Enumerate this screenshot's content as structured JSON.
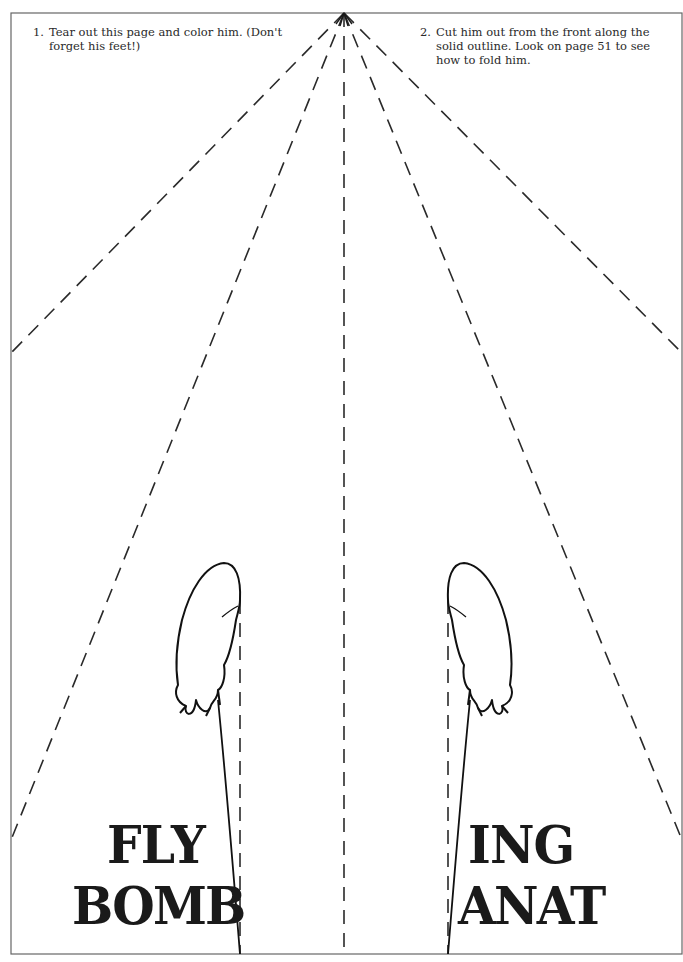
{
  "page": {
    "instructions": [
      {
        "number": "1.",
        "text": "Tear out this page and color him. (Don't forget his feet!)"
      },
      {
        "number": "2.",
        "text": "Cut him out from the front along the solid outline. Look on page 51 to see how to fold him."
      }
    ],
    "left_wing_text": {
      "line1": "FLY",
      "line2": "BOMB"
    },
    "right_wing_text": {
      "line1": "ING",
      "line2": "ANAT"
    },
    "figures": [
      "left-foot",
      "right-foot"
    ],
    "colors": {
      "ink": "#1a1a1a",
      "frame": "#555555",
      "dash": "#2a2a2a",
      "paper": "#ffffff"
    }
  }
}
